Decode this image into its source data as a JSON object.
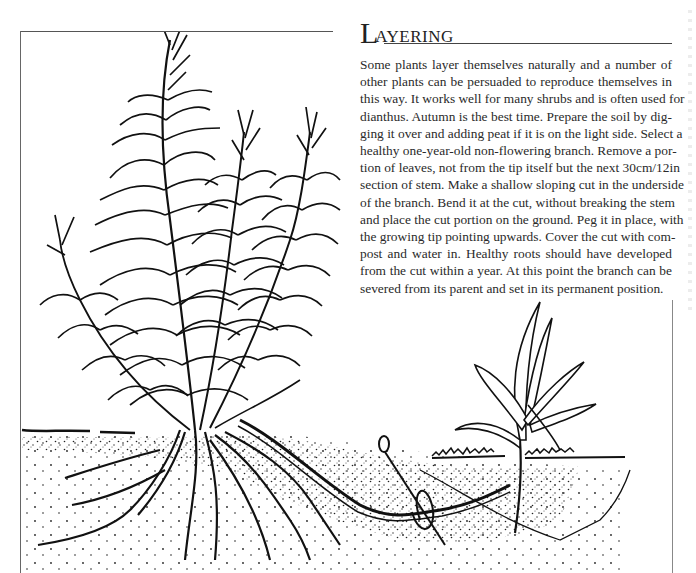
{
  "section": {
    "title_initial": "L",
    "title_rest": "AYERING",
    "body_lines": [
      "Some plants layer themselves naturally and a number of",
      "other plants can be persuaded to reproduce themselves in",
      "this way. It works well for many shrubs and is often used for",
      "dianthus. Autumn is the best time. Prepare the soil by dig-",
      "ging it over and adding peat if it is on the light side. Select a",
      "healthy one-year-old non-flowering branch. Remove a por-",
      "tion of leaves, not from the tip itself but the next 30cm/12in",
      "section of stem. Make a shallow sloping cut in the underside",
      "of the branch. Bend it at the cut, without breaking the stem",
      "and place the cut portion on the ground. Peg it in place, with",
      "the growing tip pointing upwards. Cover the cut with com-",
      "post and water in. Healthy roots should have developed",
      "from the cut within a year. At this point the branch can be",
      "severed from its parent and set in its permanent position."
    ]
  },
  "illustration": {
    "subject": "Layering: parent shrub with branch pegged into soil, new plant rooting",
    "elements": [
      "parent-plant",
      "roots",
      "soil",
      "layered-branch",
      "wire-peg",
      "new-plant",
      "grass-surface"
    ],
    "ink_color": "#111111",
    "paper_color": "#ffffff"
  }
}
